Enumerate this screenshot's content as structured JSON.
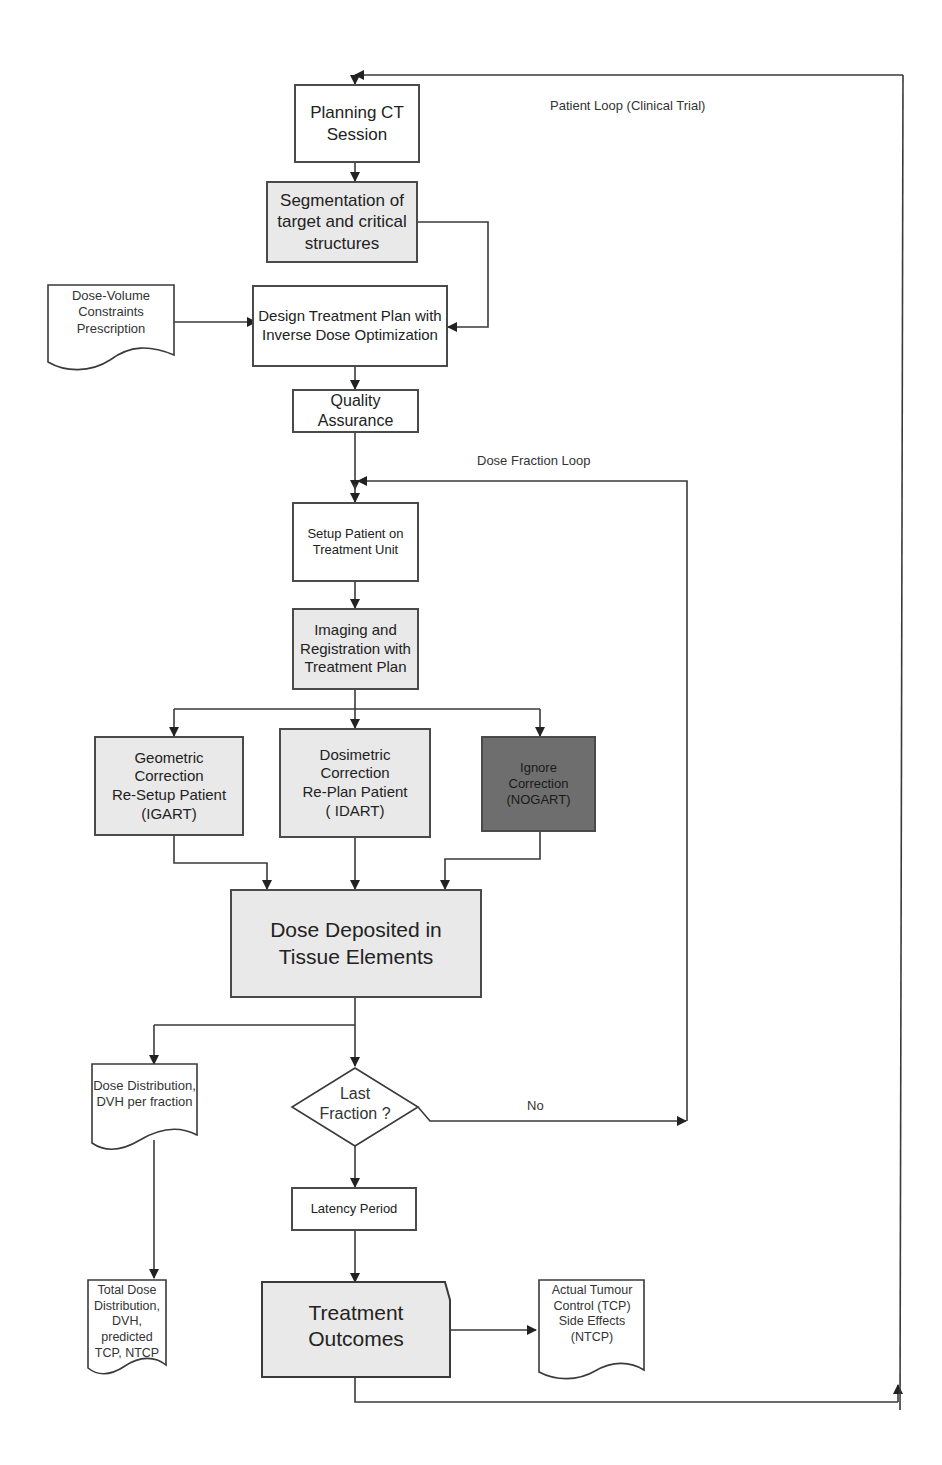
{
  "loops": {
    "patient_loop": "Patient Loop (Clinical Trial)",
    "dose_fraction_loop": "Dose Fraction Loop",
    "no_label": "No"
  },
  "nodes": {
    "planning_ct": "Planning CT\nSession",
    "segmentation": "Segmentation of\ntarget and critical\nstructures",
    "design_plan": "Design Treatment Plan with\nInverse Dose Optimization",
    "qa": "Quality\nAssurance",
    "setup_patient": "Setup Patient on\nTreatment Unit",
    "imaging": "Imaging and\nRegistration with\nTreatment Plan",
    "geometric": "Geometric\nCorrection\nRe-Setup Patient\n(IGART)",
    "dosimetric": "Dosimetric\nCorrection\nRe-Plan Patient\n( IDART)",
    "ignore": "Ignore\nCorrection\n(NOGART)",
    "dose_deposited": "Dose Deposited in\nTissue Elements",
    "last_fraction": "Last\nFraction ?",
    "latency": "Latency Period",
    "outcomes": "Treatment\nOutcomes"
  },
  "documents": {
    "constraints": "Dose-Volume\nConstraints\nPrescription",
    "dose_per_fraction": "Dose Distribution,\nDVH per fraction",
    "total_dose": "Total Dose\nDistribution, DVH,\npredicted\nTCP, NTCP",
    "actual_outcome": "Actual Tumour\nControl (TCP)\nSide Effects\n(NTCP)"
  },
  "colors": {
    "line": "#3a3a3a",
    "light_fill": "#e9e9e9",
    "dark_fill": "#6e6e6e",
    "white_fill": "#ffffff"
  }
}
